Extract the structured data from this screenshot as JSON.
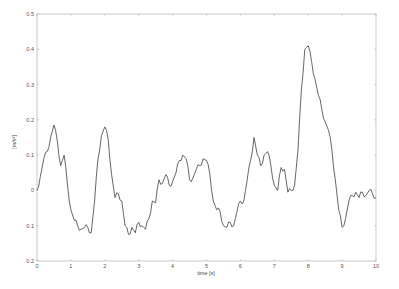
{
  "chart_data": {
    "type": "line",
    "title": "",
    "xlabel": "time [s]",
    "ylabel": "[m/s²]",
    "xlim": [
      0,
      10
    ],
    "ylim": [
      -0.2,
      0.5
    ],
    "xticks": [
      0,
      1,
      2,
      3,
      4,
      5,
      6,
      7,
      8,
      9,
      10
    ],
    "xtick_labels": [
      "0",
      "1",
      "2",
      "3",
      "4",
      "5",
      "6",
      "7",
      "8",
      "9",
      "10"
    ],
    "yticks": [
      0.5,
      0.4,
      0.3,
      0.2,
      0.1,
      0,
      -0.1,
      -0.2
    ],
    "ytick_labels": [
      "0.5",
      "0.4",
      "0.3",
      "0.2",
      "0.1",
      "0",
      "0.1",
      "0.2"
    ],
    "grid": false,
    "legend": null,
    "line_color": "#555555",
    "series": [
      {
        "name": "acceleration",
        "x": [
          0.0,
          0.1,
          0.2,
          0.3,
          0.4,
          0.5,
          0.6,
          0.7,
          0.8,
          0.9,
          1.0,
          1.1,
          1.2,
          1.3,
          1.4,
          1.5,
          1.6,
          1.7,
          1.8,
          1.9,
          2.0,
          2.1,
          2.2,
          2.3,
          2.4,
          2.5,
          2.6,
          2.7,
          2.8,
          2.9,
          3.0,
          3.1,
          3.2,
          3.3,
          3.4,
          3.5,
          3.6,
          3.7,
          3.8,
          3.9,
          4.0,
          4.1,
          4.2,
          4.3,
          4.4,
          4.5,
          4.6,
          4.7,
          4.8,
          4.9,
          5.0,
          5.1,
          5.2,
          5.3,
          5.4,
          5.5,
          5.6,
          5.7,
          5.8,
          5.9,
          6.0,
          6.1,
          6.2,
          6.3,
          6.4,
          6.5,
          6.6,
          6.7,
          6.8,
          6.9,
          7.0,
          7.1,
          7.2,
          7.3,
          7.4,
          7.5,
          7.6,
          7.7,
          7.8,
          7.9,
          8.0,
          8.1,
          8.2,
          8.3,
          8.4,
          8.5,
          8.6,
          8.7,
          8.8,
          8.9,
          9.0,
          9.1,
          9.2,
          9.3,
          9.4,
          9.5,
          9.6,
          9.7,
          9.8,
          9.9,
          10.0
        ],
        "values": [
          0.0,
          0.04,
          0.09,
          0.11,
          0.15,
          0.185,
          0.14,
          0.07,
          0.1,
          0.015,
          -0.055,
          -0.085,
          -0.1,
          -0.11,
          -0.105,
          -0.105,
          -0.12,
          -0.03,
          0.09,
          0.155,
          0.18,
          0.145,
          0.045,
          -0.02,
          -0.01,
          -0.03,
          -0.1,
          -0.125,
          -0.105,
          -0.12,
          -0.09,
          -0.1,
          -0.11,
          -0.08,
          -0.03,
          -0.035,
          0.03,
          0.02,
          0.045,
          0.015,
          0.025,
          0.05,
          0.085,
          0.1,
          0.09,
          0.03,
          0.035,
          0.06,
          0.07,
          0.09,
          0.085,
          0.045,
          -0.03,
          -0.055,
          -0.06,
          -0.1,
          -0.105,
          -0.09,
          -0.1,
          -0.06,
          -0.03,
          -0.03,
          0.03,
          0.085,
          0.15,
          0.1,
          0.07,
          0.1,
          0.11,
          0.07,
          0.015,
          0.0,
          0.065,
          0.06,
          -0.005,
          0.0,
          0.015,
          0.115,
          0.285,
          0.4,
          0.41,
          0.365,
          0.315,
          0.27,
          0.23,
          0.195,
          0.17,
          0.115,
          0.03,
          -0.055,
          -0.105,
          -0.08,
          -0.03,
          -0.015,
          -0.005,
          -0.02,
          -0.005,
          -0.015,
          0.0,
          -0.01,
          -0.02
        ]
      }
    ]
  }
}
